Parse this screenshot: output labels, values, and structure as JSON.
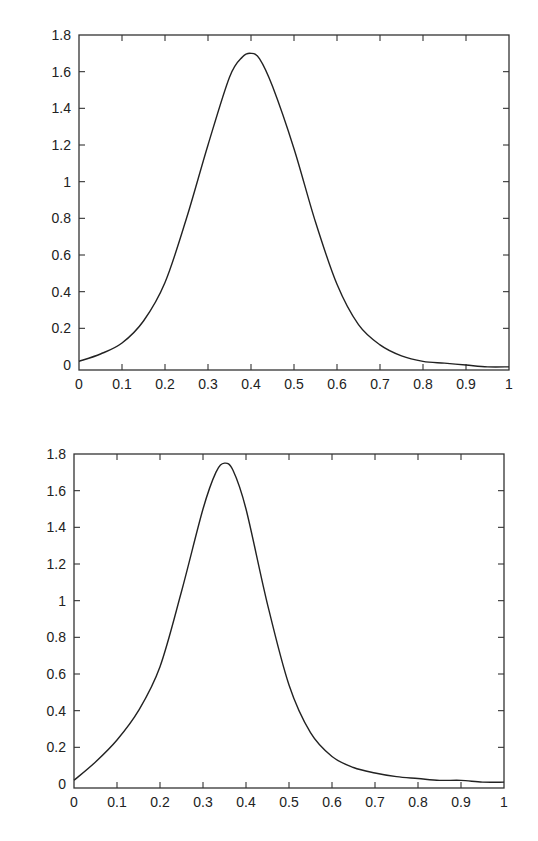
{
  "chart_data": [
    {
      "type": "line",
      "title": "",
      "xlabel": "",
      "ylabel": "",
      "xlim": [
        0,
        1
      ],
      "ylim": [
        0,
        1.8
      ],
      "grid": false,
      "x_ticks": [
        "0",
        "0.1",
        "0.2",
        "0.3",
        "0.4",
        "0.5",
        "0.6",
        "0.7",
        "0.8",
        "0.9",
        "1"
      ],
      "y_ticks": [
        "0",
        "0.2",
        "0.4",
        "0.6",
        "0.8",
        "1",
        "1.2",
        "1.4",
        "1.6",
        "1.8"
      ],
      "frame": {
        "left": 79,
        "right": 509,
        "top": 35,
        "bottom": 370,
        "y0_px": 365
      },
      "series": [
        {
          "name": "curve",
          "x": [
            0,
            0.05,
            0.1,
            0.15,
            0.2,
            0.25,
            0.3,
            0.35,
            0.38,
            0.4,
            0.42,
            0.45,
            0.5,
            0.55,
            0.6,
            0.65,
            0.7,
            0.75,
            0.8,
            0.85,
            0.9,
            0.95,
            1
          ],
          "y": [
            0.02,
            0.06,
            0.12,
            0.24,
            0.45,
            0.8,
            1.2,
            1.57,
            1.68,
            1.7,
            1.67,
            1.52,
            1.18,
            0.78,
            0.44,
            0.22,
            0.11,
            0.05,
            0.02,
            0.01,
            0.0,
            -0.01,
            -0.01
          ]
        }
      ]
    },
    {
      "type": "line",
      "title": "",
      "xlabel": "",
      "ylabel": "",
      "xlim": [
        0,
        1
      ],
      "ylim": [
        0,
        1.8
      ],
      "grid": false,
      "x_ticks": [
        "0",
        "0.1",
        "0.2",
        "0.3",
        "0.4",
        "0.5",
        "0.6",
        "0.7",
        "0.8",
        "0.9",
        "1"
      ],
      "y_ticks": [
        "0",
        "0.2",
        "0.4",
        "0.6",
        "0.8",
        "1",
        "1.2",
        "1.4",
        "1.6",
        "1.8"
      ],
      "frame": {
        "left": 74,
        "right": 504,
        "top": 454,
        "bottom": 788,
        "y0_px": 784
      },
      "series": [
        {
          "name": "curve",
          "x": [
            0,
            0.05,
            0.1,
            0.15,
            0.2,
            0.25,
            0.3,
            0.33,
            0.35,
            0.37,
            0.4,
            0.45,
            0.5,
            0.55,
            0.6,
            0.65,
            0.7,
            0.75,
            0.8,
            0.85,
            0.9,
            0.95,
            1
          ],
          "y": [
            0.02,
            0.12,
            0.24,
            0.4,
            0.64,
            1.05,
            1.5,
            1.7,
            1.75,
            1.71,
            1.5,
            0.98,
            0.54,
            0.28,
            0.15,
            0.09,
            0.06,
            0.04,
            0.03,
            0.02,
            0.02,
            0.01,
            0.01
          ]
        }
      ]
    }
  ]
}
